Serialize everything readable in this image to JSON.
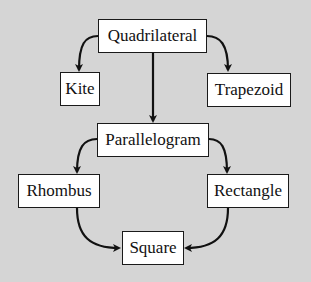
{
  "diagram": {
    "background": "#d5d5d5",
    "nodes": {
      "quadrilateral": "Quadrilateral",
      "kite": "Kite",
      "trapezoid": "Trapezoid",
      "parallelogram": "Parallelogram",
      "rhombus": "Rhombus",
      "rectangle": "Rectangle",
      "square": "Square"
    },
    "edges": [
      {
        "from": "Quadrilateral",
        "to": "Kite"
      },
      {
        "from": "Quadrilateral",
        "to": "Trapezoid"
      },
      {
        "from": "Quadrilateral",
        "to": "Parallelogram"
      },
      {
        "from": "Parallelogram",
        "to": "Rhombus"
      },
      {
        "from": "Parallelogram",
        "to": "Rectangle"
      },
      {
        "from": "Rhombus",
        "to": "Square"
      },
      {
        "from": "Rectangle",
        "to": "Square"
      }
    ]
  }
}
